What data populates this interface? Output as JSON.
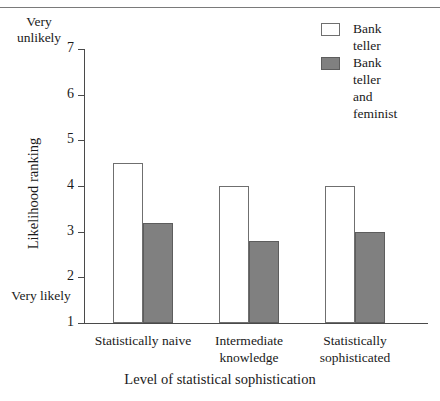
{
  "chart_data": {
    "type": "bar",
    "title": "",
    "xlabel": "Level of statistical sophistication",
    "ylabel": "Likelihood ranking",
    "categories": [
      "Statistically\nnaive",
      "Intermediate\nknowledge",
      "Statistically\nsophisticated"
    ],
    "series": [
      {
        "name": "Bank teller",
        "values": [
          4.5,
          4.0,
          4.0
        ],
        "color": "#ffffff"
      },
      {
        "name": "Bank teller\nand feminist",
        "values": [
          3.2,
          2.8,
          3.0
        ],
        "color": "#808080"
      }
    ],
    "ylim": [
      1,
      7
    ],
    "yticks": [
      7,
      6,
      5,
      4,
      3,
      2,
      1
    ],
    "ytick_labels": [
      "7",
      "6",
      "5",
      "4",
      "3",
      "2",
      "1"
    ],
    "y_axis_high_caption": "Very\nunlikely",
    "y_axis_low_caption": "Very\nlikely",
    "grid": false,
    "legend_position": "top-right"
  },
  "legend": {
    "entries": [
      {
        "label": "Bank teller",
        "color": "#ffffff"
      },
      {
        "label": "Bank teller\nand feminist",
        "color": "#808080"
      }
    ]
  },
  "axes": {
    "y_title": "Likelihood ranking",
    "x_title": "Level of statistical sophistication",
    "y_top_caption": "Very\nunlikely",
    "y_bottom_caption": "Very\nlikely",
    "y_tick_labels": [
      "7",
      "6",
      "5",
      "4",
      "3",
      "2",
      "1"
    ],
    "x_tick_labels": [
      "Statistically\nnaive",
      "Intermediate\nknowledge",
      "Statistically\nsophisticated"
    ]
  }
}
